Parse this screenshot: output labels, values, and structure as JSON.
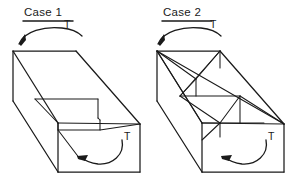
{
  "figure": {
    "background_color": "#ffffff",
    "line_color": "#1a1a1a",
    "width": 286,
    "height": 192
  },
  "cases": [
    {
      "id": "case-1",
      "title": "Case 1",
      "torque_label_top": "T",
      "torque_label_bottom": "T",
      "structure": "open-top rectangular box with a single transverse interior wall, no diagonal bracing",
      "top_arrow": {
        "semantic": "counterclockwise-torque-arrow",
        "direction": "right-to-left",
        "arrowhead_at": "left"
      },
      "bottom_arrow": {
        "semantic": "counterclockwise-torque-arrow",
        "direction": "top-right-to-bottom-left",
        "arrowhead_at": "left"
      }
    },
    {
      "id": "case-2",
      "title": "Case 2",
      "torque_label_top": "T",
      "torque_label_bottom": "T",
      "structure": "open-top rectangular box with diagonal cross-bracing truss members across the open top",
      "top_arrow": {
        "semantic": "counterclockwise-torque-arrow",
        "direction": "right-to-left",
        "arrowhead_at": "left"
      },
      "bottom_arrow": {
        "semantic": "counterclockwise-torque-arrow",
        "direction": "top-right-to-bottom-left",
        "arrowhead_at": "left"
      }
    }
  ]
}
